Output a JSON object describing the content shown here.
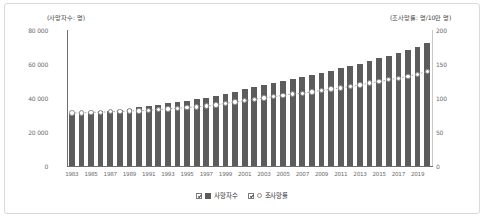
{
  "chart_data": {
    "type": "bar",
    "title": "",
    "subtitle": "",
    "xlabel": "",
    "ylabel": "(사망자수: 명)",
    "ylabel_right": "(조사망률: 명/10만 명)",
    "ylim": [
      0,
      80000
    ],
    "ylim_right": [
      0,
      200
    ],
    "grid": false,
    "legend_position": "bottom",
    "yticks_left": [
      "0",
      "20 000",
      "40 000",
      "60 000",
      "80 000"
    ],
    "yticks_left_values": [
      0,
      20000,
      40000,
      60000,
      80000
    ],
    "yticks_right": [
      "0",
      "50",
      "100",
      "150",
      "200"
    ],
    "yticks_right_values": [
      0,
      50,
      100,
      150,
      200
    ],
    "categories": [
      "1983",
      "1984",
      "1985",
      "1986",
      "1987",
      "1988",
      "1989",
      "1990",
      "1991",
      "1992",
      "1993",
      "1994",
      "1995",
      "1996",
      "1997",
      "1998",
      "1999",
      "2000",
      "2001",
      "2002",
      "2003",
      "2004",
      "2005",
      "2006",
      "2007",
      "2008",
      "2009",
      "2010",
      "2011",
      "2012",
      "2013",
      "2014",
      "2015",
      "2016",
      "2017",
      "2018",
      "2019",
      "2020"
    ],
    "xtick_labels": [
      "1983",
      "1985",
      "1987",
      "1989",
      "1991",
      "1993",
      "1995",
      "1997",
      "1999",
      "2001",
      "2003",
      "2005",
      "2007",
      "2009",
      "2011",
      "2013",
      "2015",
      "2017",
      "2019"
    ],
    "series": [
      {
        "name": "사망자수",
        "type": "bar",
        "axis": "left",
        "color": "#5c5c5c",
        "values": [
          31100,
          31300,
          31700,
          32200,
          32600,
          33100,
          33800,
          34500,
          35200,
          36000,
          36800,
          37600,
          38500,
          39300,
          40000,
          41100,
          42400,
          43800,
          45200,
          46500,
          47900,
          49100,
          50200,
          51300,
          52400,
          53600,
          54800,
          56000,
          57400,
          58800,
          60300,
          61800,
          63500,
          65000,
          66700,
          68400,
          70200,
          72300
        ]
      },
      {
        "name": "조사망률",
        "type": "line",
        "axis": "right",
        "marker": "open-circle",
        "line_style": "dotted",
        "color": "#8a8a8a",
        "values": [
          78,
          78,
          79,
          79,
          80,
          80,
          81,
          81,
          82,
          83,
          84,
          85,
          86,
          87,
          88,
          90,
          92,
          94,
          96,
          98,
          100,
          102,
          104,
          106,
          107,
          109,
          111,
          113,
          115,
          117,
          119,
          122,
          124,
          127,
          129,
          132,
          135,
          139
        ]
      }
    ]
  },
  "legend": {
    "items": [
      {
        "label": "사망자수",
        "swatch": "bar-swatch",
        "checked": true
      },
      {
        "label": "조사망률",
        "swatch": "dot-swatch",
        "checked": true
      }
    ]
  }
}
